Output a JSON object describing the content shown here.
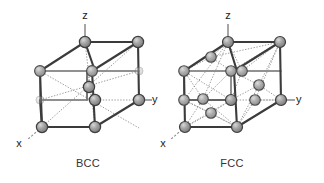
{
  "figure": {
    "background_color": "#ffffff",
    "atom_fill": "#9a9a9a",
    "atom_stroke": "#4a4a4a",
    "edge_color": "#3b3b3b",
    "width": 324,
    "height": 183
  },
  "cells": [
    {
      "id": "bcc",
      "caption": "BCC",
      "caption_x": 88,
      "caption_y": 167,
      "axes": [
        {
          "name": "z",
          "label": "z",
          "label_x": 85,
          "label_y": 19
        },
        {
          "name": "y",
          "label": "y",
          "label_x": 152,
          "label_y": 103
        },
        {
          "name": "x",
          "label": "x",
          "label_y": 147,
          "label_x": 19
        }
      ],
      "atom_count": 9,
      "corner_atoms": 8,
      "interior_atoms": 1
    },
    {
      "id": "fcc",
      "caption": "FCC",
      "caption_x": 232,
      "caption_y": 167,
      "axes": [
        {
          "name": "z",
          "label": "z",
          "label_x": 228,
          "label_y": 19
        },
        {
          "name": "y",
          "label": "y",
          "label_x": 296,
          "label_y": 103
        },
        {
          "name": "x",
          "label": "x",
          "label_x": 163,
          "label_y": 147
        }
      ],
      "atom_count": 14,
      "corner_atoms": 8,
      "face_atoms": 6
    }
  ]
}
